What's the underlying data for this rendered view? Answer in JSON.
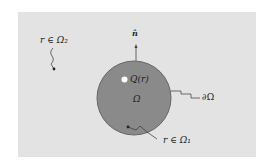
{
  "diagram": {
    "labels": {
      "normal": "n̂",
      "source": "Q(r)",
      "domain": "Ω",
      "boundary": "∂Ω",
      "outside_point": "r ∈ Ω₂",
      "inside_point": "r ∈ Ω₁"
    },
    "colors": {
      "background": "#e3e3e3",
      "domain_fill": "#8a8a8a",
      "domain_stroke": "#666666",
      "lines": "#333333"
    }
  }
}
